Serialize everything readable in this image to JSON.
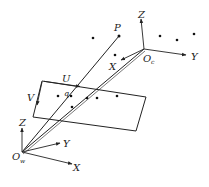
{
  "diagram": {
    "type": "camera-projection-geometry",
    "labels": {
      "point": "P",
      "image_point": "q",
      "image_u": "U",
      "image_v": "V",
      "camera_origin": "O",
      "camera_origin_sub": "c",
      "world_origin": "O",
      "world_origin_sub": "w",
      "camera_axes": {
        "x": "X",
        "y": "Y",
        "z": "Z"
      },
      "world_axes": {
        "x": "X",
        "y": "Y",
        "z": "Z"
      }
    },
    "colors": {
      "stroke": "#222222",
      "background": "#ffffff"
    }
  }
}
